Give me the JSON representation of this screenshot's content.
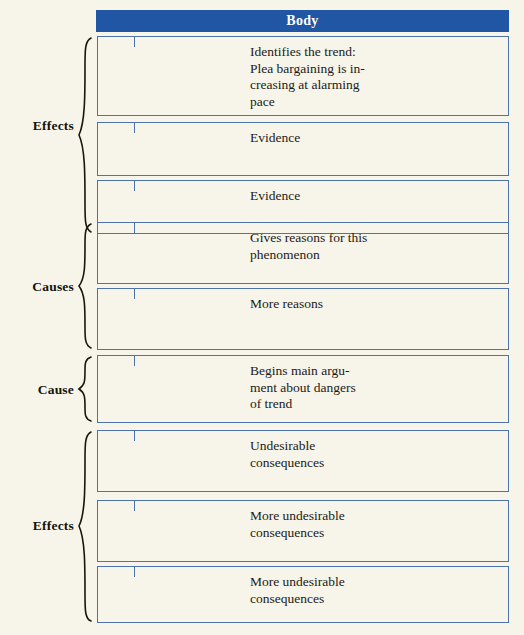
{
  "diagram": {
    "title": "Body",
    "header": {
      "label": "Body",
      "bar_color": "#2156a5",
      "text_color": "#ffffff"
    },
    "background_color": "#f7f4e9",
    "box_border_color": "#4d73ad",
    "groups": [
      {
        "label": "Effects",
        "box_indices": [
          0,
          1,
          2
        ]
      },
      {
        "label": "Causes",
        "box_indices": [
          3,
          4
        ]
      },
      {
        "label": "Cause",
        "box_indices": [
          5
        ]
      },
      {
        "label": "Effects",
        "box_indices": [
          6,
          7,
          8
        ]
      }
    ],
    "boxes": [
      {
        "text": "Identifies the trend:\nPlea bargaining is in-\ncreasing at alarming\npace"
      },
      {
        "text": "Evidence"
      },
      {
        "text": "Evidence"
      },
      {
        "text": "Gives reasons for this\nphenomenon"
      },
      {
        "text": "More reasons"
      },
      {
        "text": "Begins main argu-\nment about dangers\nof trend"
      },
      {
        "text": "Undesirable\nconsequences"
      },
      {
        "text": "More undesirable\nconsequences"
      },
      {
        "text": "More undesirable\nconsequences"
      }
    ]
  }
}
